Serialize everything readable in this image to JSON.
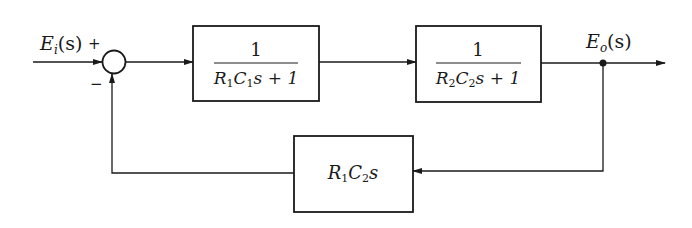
{
  "diagram": {
    "type": "block-diagram",
    "input": {
      "label_main": "E",
      "label_sub": "i",
      "label_tail": "(s)"
    },
    "output": {
      "label_main": "E",
      "label_sub": "o",
      "label_tail": "(s)"
    },
    "summing_junction": {
      "plus_sign": "+",
      "minus_sign": "−"
    },
    "blocks": [
      {
        "id": "G1",
        "numerator": "1",
        "den_R": "R",
        "den_R_sub": "1",
        "den_C": "C",
        "den_C_sub": "1",
        "den_tail": "s + 1"
      },
      {
        "id": "G2",
        "numerator": "1",
        "den_R": "R",
        "den_R_sub": "2",
        "den_C": "C",
        "den_C_sub": "2",
        "den_tail": "s + 1"
      }
    ],
    "feedback_block": {
      "R": "R",
      "R_sub": "1",
      "C": "C",
      "C_sub": "2",
      "tail": "s"
    },
    "colors": {
      "stroke": "#1a1a1a",
      "background": "#ffffff"
    }
  }
}
